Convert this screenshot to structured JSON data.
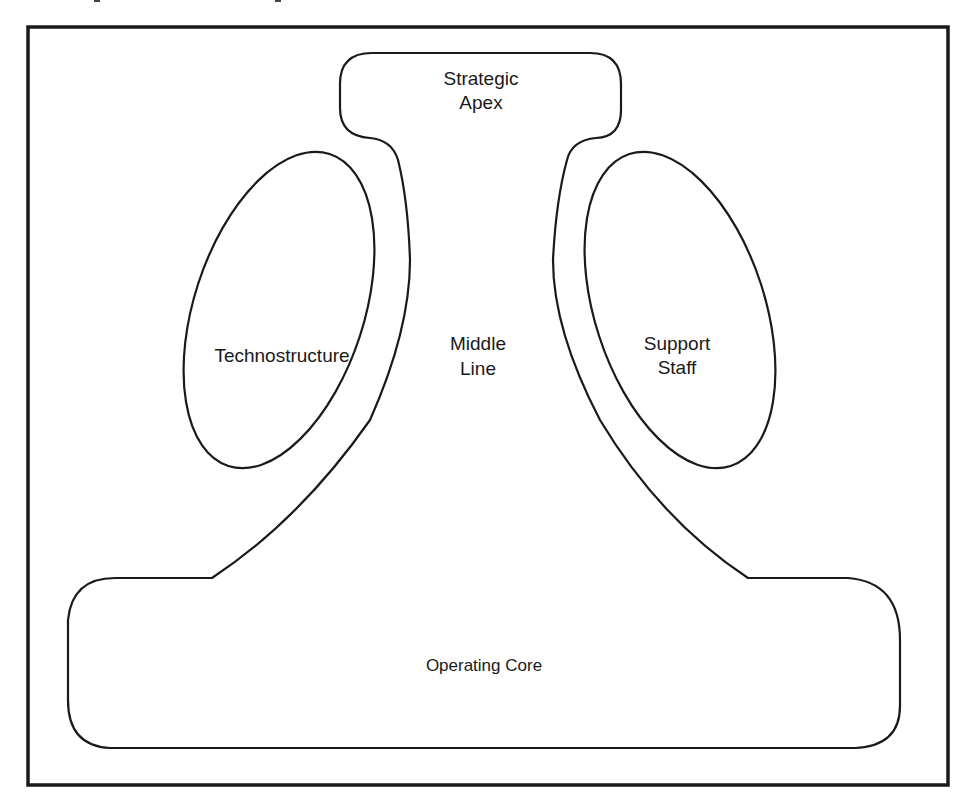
{
  "diagram": {
    "type": "organizational-structure",
    "components": {
      "strategic_apex": {
        "line1": "Strategic",
        "line2": "Apex"
      },
      "technostructure": {
        "label": "Technostructure"
      },
      "middle_line": {
        "line1": "Middle",
        "line2": "Line"
      },
      "support_staff": {
        "line1": "Support",
        "line2": "Staff"
      },
      "operating_core": {
        "label": "Operating Core"
      }
    },
    "colors": {
      "stroke": "#1a1a1a",
      "background": "#ffffff"
    }
  }
}
